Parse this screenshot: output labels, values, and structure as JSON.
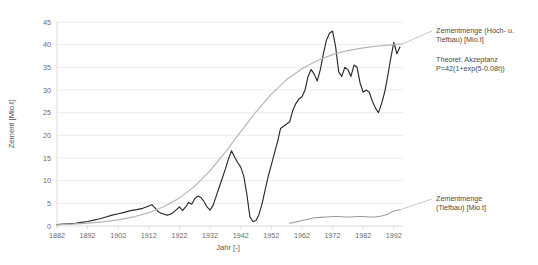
{
  "chart_data": {
    "type": "line",
    "title": "",
    "xlabel": "Jahr [-]",
    "ylabel": "Zement [Mio.t]",
    "xlim": [
      1882,
      1995
    ],
    "ylim": [
      0,
      45
    ],
    "grid": true,
    "legend_position": "right-inline",
    "xticks": [
      1882,
      1892,
      1902,
      1912,
      1922,
      1932,
      1942,
      1952,
      1962,
      1972,
      1982,
      1992
    ],
    "yticks": [
      0,
      5,
      10,
      15,
      20,
      25,
      30,
      35,
      40,
      45
    ],
    "annotations": [
      "Zementmenge (Hoch- u. Tiefbau) [Mio.t]",
      "Theoret. Akzeptanz P=42(1+exp(5-0.08t))",
      "Zementmenge (Tiefbau) [Mio.t]"
    ],
    "series": [
      {
        "name": "Zementmenge (Hoch- u. Tiefbau) [Mio.t]",
        "color": "#2b2b2b",
        "x": [
          1882,
          1884,
          1886,
          1888,
          1890,
          1892,
          1894,
          1896,
          1898,
          1900,
          1902,
          1904,
          1906,
          1908,
          1910,
          1912,
          1913,
          1914,
          1915,
          1916,
          1917,
          1918,
          1919,
          1920,
          1921,
          1922,
          1923,
          1924,
          1925,
          1926,
          1927,
          1928,
          1929,
          1930,
          1931,
          1932,
          1933,
          1934,
          1935,
          1936,
          1937,
          1938,
          1939,
          1940,
          1941,
          1942,
          1943,
          1944,
          1945,
          1946,
          1947,
          1948,
          1949,
          1950,
          1951,
          1952,
          1953,
          1954,
          1955,
          1956,
          1957,
          1958,
          1959,
          1960,
          1961,
          1962,
          1963,
          1964,
          1965,
          1966,
          1967,
          1968,
          1969,
          1970,
          1971,
          1972,
          1973,
          1974,
          1975,
          1976,
          1977,
          1978,
          1979,
          1980,
          1981,
          1982,
          1983,
          1984,
          1985,
          1986,
          1987,
          1988,
          1989,
          1990,
          1991,
          1992,
          1993,
          1994
        ],
        "y": [
          0.3,
          0.4,
          0.5,
          0.6,
          0.8,
          1.0,
          1.3,
          1.6,
          2.0,
          2.4,
          2.7,
          3.0,
          3.4,
          3.6,
          3.9,
          4.4,
          4.7,
          4.0,
          3.2,
          2.8,
          2.6,
          2.4,
          2.6,
          3.0,
          3.6,
          4.2,
          3.4,
          4.2,
          5.2,
          4.8,
          6.0,
          6.6,
          6.3,
          5.4,
          4.2,
          3.5,
          4.6,
          6.6,
          8.6,
          10.6,
          12.6,
          14.8,
          16.6,
          15.2,
          14.0,
          13.0,
          11.0,
          7.0,
          2.0,
          1.0,
          1.2,
          2.6,
          5.0,
          8.0,
          11.0,
          13.5,
          16.0,
          18.5,
          21.5,
          22.0,
          22.5,
          23.0,
          25.5,
          27.0,
          28.0,
          28.5,
          30.0,
          33.0,
          34.5,
          33.5,
          32.0,
          34.5,
          38.0,
          41.0,
          42.5,
          43.0,
          39.5,
          34.0,
          33.0,
          35.0,
          34.5,
          33.0,
          35.5,
          35.0,
          31.5,
          29.5,
          30.0,
          29.5,
          27.5,
          26.0,
          25.0,
          27.0,
          29.5,
          33.0,
          37.0,
          40.5,
          38.0,
          39.5
        ]
      },
      {
        "name": "Theoret. Akzeptanz P=42(1+exp(5-0.08t))",
        "color": "#b4b4b4",
        "x": [
          1882,
          1887,
          1892,
          1897,
          1902,
          1907,
          1912,
          1917,
          1922,
          1927,
          1932,
          1937,
          1942,
          1947,
          1952,
          1957,
          1962,
          1967,
          1972,
          1977,
          1982,
          1987,
          1992,
          1995
        ],
        "y": [
          0.28,
          0.42,
          0.62,
          0.92,
          1.36,
          2.0,
          2.94,
          4.3,
          6.2,
          8.8,
          12.2,
          16.3,
          20.8,
          25.2,
          29.1,
          32.3,
          34.7,
          36.5,
          37.8,
          38.7,
          39.3,
          39.7,
          40.0,
          40.2
        ]
      },
      {
        "name": "Zementmenge (Tiefbau) [Mio.t]",
        "color": "#9a9a9a",
        "x": [
          1958,
          1960,
          1962,
          1964,
          1966,
          1968,
          1970,
          1972,
          1974,
          1976,
          1978,
          1980,
          1982,
          1984,
          1986,
          1988,
          1990,
          1992,
          1994
        ],
        "y": [
          0.6,
          0.9,
          1.2,
          1.5,
          1.8,
          1.9,
          2.0,
          2.1,
          2.1,
          2.0,
          2.0,
          2.1,
          2.1,
          2.0,
          2.0,
          2.2,
          2.6,
          3.3,
          3.6
        ]
      }
    ]
  },
  "legend": {
    "main_line1": "Zementmenge (Hoch- u.",
    "main_line2": "Tiefbau) [Mio.t]",
    "theory_line1": "Theoret. Akzeptanz",
    "theory_line2": "P=42(1+exp(5-0.08t))",
    "tiefbau_line1": "Zementmenge",
    "tiefbau_line2": "(Tiefbau) [Mio.t]"
  }
}
